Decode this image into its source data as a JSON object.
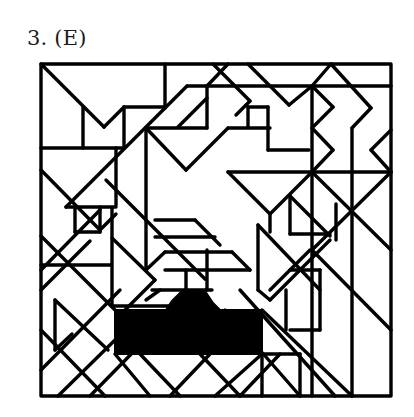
{
  "figure": {
    "label": "3. (E)",
    "stroke_color": "#000000",
    "background_color": "#ffffff",
    "fill_color": "#000000"
  }
}
